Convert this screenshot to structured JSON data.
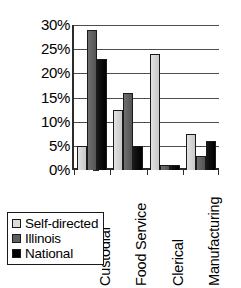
{
  "chart_data": {
    "type": "bar",
    "title": "",
    "xlabel": "",
    "ylabel": "",
    "categories": [
      "Custodial",
      "Food Service",
      "Clerical",
      "Manufacturing"
    ],
    "series": [
      {
        "name": "Self-directed",
        "color": "#dcdcdc",
        "values": [
          5,
          12.5,
          24,
          7.5
        ]
      },
      {
        "name": "Illinois",
        "color": "#5e5e5e",
        "values": [
          29,
          16,
          1,
          3
        ]
      },
      {
        "name": "National",
        "color": "#000000",
        "values": [
          23,
          5,
          1,
          6
        ]
      }
    ],
    "ylim": [
      0,
      30
    ],
    "ytick_values": [
      0,
      5,
      10,
      15,
      20,
      25,
      30
    ],
    "ytick_labels": [
      "0%",
      "5%",
      "10%",
      "15%",
      "20%",
      "25%",
      "30%"
    ],
    "grid": true,
    "legend_position": "bottom-left",
    "orientation": "vertical",
    "xtick_rotation": -90
  }
}
